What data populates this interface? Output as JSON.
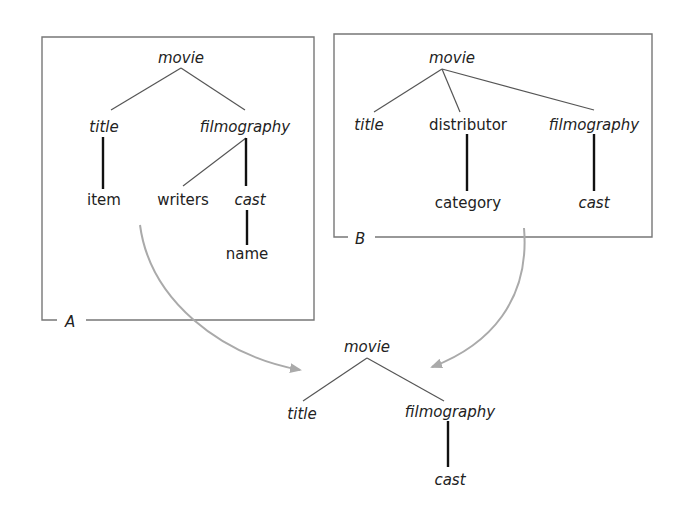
{
  "diagram": {
    "type": "tree-merge",
    "tree_a": {
      "label": "A",
      "nodes": [
        {
          "id": "a_movie",
          "text": "movie",
          "italic": true
        },
        {
          "id": "a_title",
          "text": "title",
          "italic": true
        },
        {
          "id": "a_filmography",
          "text": "filmography",
          "italic": true
        },
        {
          "id": "a_item",
          "text": "item",
          "italic": false
        },
        {
          "id": "a_writers",
          "text": "writers",
          "italic": false
        },
        {
          "id": "a_cast",
          "text": "cast",
          "italic": true
        },
        {
          "id": "a_name",
          "text": "name",
          "italic": false
        }
      ],
      "edges": [
        [
          "a_movie",
          "a_title",
          "thin"
        ],
        [
          "a_movie",
          "a_filmography",
          "thin"
        ],
        [
          "a_title",
          "a_item",
          "thick"
        ],
        [
          "a_filmography",
          "a_writers",
          "thin"
        ],
        [
          "a_filmography",
          "a_cast",
          "thick"
        ],
        [
          "a_cast",
          "a_name",
          "thick"
        ]
      ]
    },
    "tree_b": {
      "label": "B",
      "nodes": [
        {
          "id": "b_movie",
          "text": "movie",
          "italic": true
        },
        {
          "id": "b_title",
          "text": "title",
          "italic": true
        },
        {
          "id": "b_distributor",
          "text": "distributor",
          "italic": false
        },
        {
          "id": "b_filmography",
          "text": "filmography",
          "italic": true
        },
        {
          "id": "b_category",
          "text": "category",
          "italic": false
        },
        {
          "id": "b_cast",
          "text": "cast",
          "italic": true
        }
      ],
      "edges": [
        [
          "b_movie",
          "b_title",
          "thin"
        ],
        [
          "b_movie",
          "b_distributor",
          "thin"
        ],
        [
          "b_movie",
          "b_filmography",
          "thin"
        ],
        [
          "b_distributor",
          "b_category",
          "thick"
        ],
        [
          "b_filmography",
          "b_cast",
          "thick"
        ]
      ]
    },
    "result": {
      "nodes": [
        {
          "id": "r_movie",
          "text": "movie",
          "italic": true
        },
        {
          "id": "r_title",
          "text": "title",
          "italic": true
        },
        {
          "id": "r_filmography",
          "text": "filmography",
          "italic": true
        },
        {
          "id": "r_cast",
          "text": "cast",
          "italic": true
        }
      ],
      "edges": [
        [
          "r_movie",
          "r_title",
          "thin"
        ],
        [
          "r_movie",
          "r_filmography",
          "thin"
        ],
        [
          "r_filmography",
          "r_cast",
          "thick"
        ]
      ]
    },
    "arrows": [
      {
        "from": "tree_a",
        "to": "result"
      },
      {
        "from": "tree_b",
        "to": "result"
      }
    ],
    "colors": {
      "box": "#777777",
      "arrow": "#aaaaaa",
      "edge_thin": "#555555",
      "edge_thick": "#111111",
      "text": "#222222"
    }
  }
}
